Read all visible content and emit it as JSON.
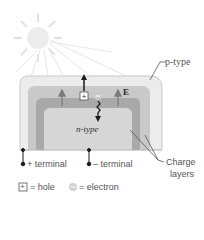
{
  "labels": {
    "p_type": "p-type",
    "n_type": "n-type",
    "field": "E",
    "plus_terminal": "+ terminal",
    "minus_terminal": "– terminal",
    "charge_layers_1": "Charge",
    "charge_layers_2": "layers"
  },
  "legend": {
    "hole_symbol": "+",
    "hole_label": "= hole",
    "electron_symbol": "–",
    "electron_label": "= electron"
  },
  "colors": {
    "sun": "#e8e8e8",
    "p_layer": "#ececec",
    "charge_layer_outer": "#c8c8c8",
    "charge_layer_inner": "#a8a8a8",
    "n_layer": "#d6d6d6",
    "arrow": "#1a1a1a",
    "field_arrow": "#7a7a7a"
  }
}
